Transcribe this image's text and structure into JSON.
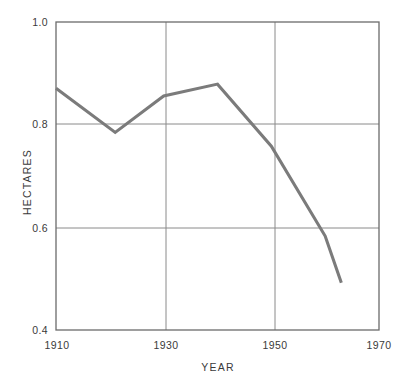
{
  "chart_data": {
    "type": "line",
    "title": "",
    "xlabel": "YEAR",
    "ylabel": "HECTARES",
    "xlim": [
      1910,
      1970
    ],
    "ylim": [
      0.4,
      1.0
    ],
    "grid": true,
    "legend": false,
    "legend_position": "none",
    "line_color": "#7b7b7b",
    "axis_color": "#6b6b6b",
    "grid_color": "#8a8a8a",
    "x_ticks": [
      "1910",
      "1930",
      "1950",
      "1970"
    ],
    "x_tick_values": [
      1910,
      1930,
      1950,
      1970
    ],
    "y_ticks": [
      "1.0",
      "0.8",
      "0.6",
      "0.4"
    ],
    "y_tick_values": [
      1.0,
      0.8,
      0.6,
      0.4
    ],
    "series": [
      {
        "name": "hectares",
        "x": [
          1910,
          1921,
          1930,
          1940,
          1950,
          1960,
          1963
        ],
        "values": [
          0.871,
          0.785,
          0.856,
          0.879,
          0.758,
          0.583,
          0.492
        ]
      }
    ]
  }
}
